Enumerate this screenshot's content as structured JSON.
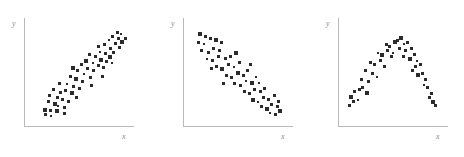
{
  "figure": {
    "background_color": "#ffffff",
    "axis_color": "#b9b9b9",
    "label_color": "#8c8c8c",
    "marker_color": "#2b2b2b"
  },
  "chart_data": [
    {
      "type": "scatter",
      "title": "",
      "xlabel": "x",
      "ylabel": "y",
      "relationship": "positive linear correlation",
      "xlim": [
        0,
        100
      ],
      "ylim": [
        0,
        100
      ],
      "grid": false,
      "legend": "none",
      "points": [
        [
          18,
          14
        ],
        [
          23,
          13
        ],
        [
          18,
          9
        ],
        [
          24,
          8
        ],
        [
          21,
          22
        ],
        [
          27,
          20
        ],
        [
          22,
          28
        ],
        [
          30,
          26
        ],
        [
          26,
          34
        ],
        [
          33,
          31
        ],
        [
          30,
          18
        ],
        [
          36,
          16
        ],
        [
          34,
          24
        ],
        [
          40,
          22
        ],
        [
          37,
          33
        ],
        [
          43,
          30
        ],
        [
          32,
          40
        ],
        [
          39,
          39
        ],
        [
          45,
          37
        ],
        [
          50,
          35
        ],
        [
          47,
          44
        ],
        [
          42,
          47
        ],
        [
          53,
          42
        ],
        [
          49,
          52
        ],
        [
          55,
          49
        ],
        [
          44,
          55
        ],
        [
          52,
          58
        ],
        [
          58,
          54
        ],
        [
          61,
          46
        ],
        [
          64,
          52
        ],
        [
          57,
          62
        ],
        [
          63,
          60
        ],
        [
          68,
          57
        ],
        [
          60,
          68
        ],
        [
          66,
          66
        ],
        [
          71,
          63
        ],
        [
          73,
          55
        ],
        [
          76,
          61
        ],
        [
          70,
          71
        ],
        [
          75,
          69
        ],
        [
          79,
          66
        ],
        [
          68,
          76
        ],
        [
          74,
          78
        ],
        [
          80,
          74
        ],
        [
          83,
          70
        ],
        [
          78,
          82
        ],
        [
          84,
          79
        ],
        [
          88,
          75
        ],
        [
          82,
          86
        ],
        [
          87,
          84
        ],
        [
          91,
          80
        ],
        [
          86,
          90
        ],
        [
          90,
          88
        ],
        [
          94,
          84
        ],
        [
          36,
          10
        ],
        [
          29,
          13
        ],
        [
          48,
          26
        ],
        [
          62,
          38
        ],
        [
          72,
          47
        ],
        [
          81,
          60
        ]
      ]
    },
    {
      "type": "scatter",
      "title": "",
      "xlabel": "x",
      "ylabel": "y",
      "relationship": "negative linear correlation",
      "xlim": [
        0,
        100
      ],
      "ylim": [
        0,
        100
      ],
      "grid": false,
      "legend": "none",
      "points": [
        [
          14,
          88
        ],
        [
          19,
          86
        ],
        [
          13,
          80
        ],
        [
          18,
          78
        ],
        [
          24,
          84
        ],
        [
          29,
          82
        ],
        [
          16,
          72
        ],
        [
          22,
          70
        ],
        [
          27,
          74
        ],
        [
          33,
          72
        ],
        [
          21,
          64
        ],
        [
          26,
          62
        ],
        [
          32,
          66
        ],
        [
          38,
          64
        ],
        [
          30,
          56
        ],
        [
          35,
          54
        ],
        [
          41,
          58
        ],
        [
          46,
          56
        ],
        [
          39,
          48
        ],
        [
          44,
          46
        ],
        [
          50,
          50
        ],
        [
          55,
          48
        ],
        [
          47,
          40
        ],
        [
          52,
          38
        ],
        [
          58,
          42
        ],
        [
          63,
          40
        ],
        [
          56,
          32
        ],
        [
          61,
          30
        ],
        [
          66,
          34
        ],
        [
          71,
          32
        ],
        [
          64,
          24
        ],
        [
          69,
          22
        ],
        [
          74,
          26
        ],
        [
          79,
          24
        ],
        [
          72,
          17
        ],
        [
          77,
          15
        ],
        [
          82,
          19
        ],
        [
          87,
          17
        ],
        [
          80,
          11
        ],
        [
          85,
          9
        ],
        [
          90,
          13
        ],
        [
          36,
          40
        ],
        [
          43,
          66
        ],
        [
          51,
          60
        ],
        [
          59,
          52
        ],
        [
          67,
          46
        ],
        [
          75,
          35
        ],
        [
          84,
          28
        ],
        [
          25,
          54
        ],
        [
          34,
          80
        ],
        [
          48,
          70
        ],
        [
          62,
          58
        ],
        [
          70,
          40
        ],
        [
          88,
          22
        ]
      ]
    },
    {
      "type": "scatter",
      "title": "",
      "xlabel": "x",
      "ylabel": "y",
      "relationship": "curvilinear inverted-U relationship",
      "xlim": [
        0,
        100
      ],
      "ylim": [
        0,
        100
      ],
      "grid": false,
      "legend": "none",
      "points": [
        [
          10,
          26
        ],
        [
          14,
          32
        ],
        [
          9,
          18
        ],
        [
          17,
          24
        ],
        [
          21,
          36
        ],
        [
          25,
          30
        ],
        [
          20,
          44
        ],
        [
          27,
          42
        ],
        [
          31,
          50
        ],
        [
          24,
          52
        ],
        [
          35,
          46
        ],
        [
          33,
          58
        ],
        [
          38,
          62
        ],
        [
          29,
          60
        ],
        [
          42,
          56
        ],
        [
          40,
          68
        ],
        [
          45,
          72
        ],
        [
          36,
          70
        ],
        [
          49,
          66
        ],
        [
          47,
          76
        ],
        [
          52,
          80
        ],
        [
          44,
          78
        ],
        [
          56,
          74
        ],
        [
          54,
          82
        ],
        [
          60,
          78
        ],
        [
          58,
          84
        ],
        [
          64,
          80
        ],
        [
          62,
          72
        ],
        [
          67,
          74
        ],
        [
          70,
          68
        ],
        [
          66,
          64
        ],
        [
          73,
          62
        ],
        [
          71,
          56
        ],
        [
          76,
          58
        ],
        [
          78,
          50
        ],
        [
          74,
          48
        ],
        [
          81,
          44
        ],
        [
          83,
          36
        ],
        [
          79,
          38
        ],
        [
          86,
          30
        ],
        [
          88,
          22
        ],
        [
          84,
          26
        ],
        [
          90,
          18
        ],
        [
          13,
          22
        ],
        [
          18,
          34
        ],
        [
          50,
          70
        ],
        [
          60,
          66
        ],
        [
          68,
          52
        ]
      ]
    }
  ]
}
